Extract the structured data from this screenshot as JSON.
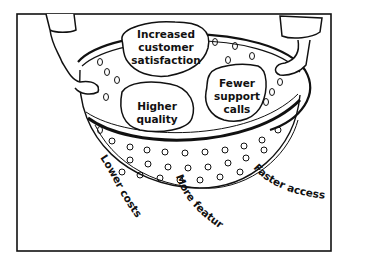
{
  "illustration": {
    "subject": "colander held by two hands",
    "blobs": [
      {
        "lines": [
          "Increased",
          "customer",
          "satisfaction"
        ]
      },
      {
        "lines": [
          "Fewer",
          "support",
          "calls"
        ]
      },
      {
        "lines": [
          "Higher",
          "quality"
        ]
      }
    ],
    "falling_labels": [
      {
        "text": "Lower costs"
      },
      {
        "text": "More features"
      },
      {
        "text": "Faster access"
      }
    ],
    "colors": {
      "ink": "#111111",
      "background": "#ffffff"
    }
  }
}
